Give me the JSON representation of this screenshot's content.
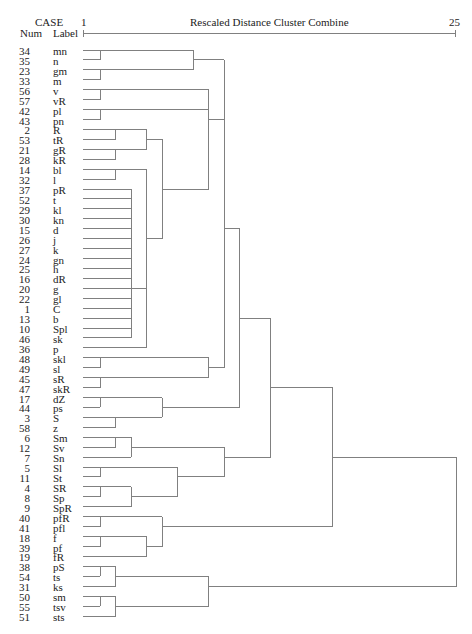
{
  "chart_data": {
    "type": "dendrogram",
    "title": "Rescaled Distance Cluster Combine",
    "header": {
      "case": "CASE",
      "num": "Num",
      "label": "Label"
    },
    "axis": {
      "label": "Rescaled Distance Cluster Combine",
      "range": [
        1,
        25
      ],
      "tick_labels": [
        "1",
        "25"
      ],
      "grid": false
    },
    "leaves": [
      {
        "num": 34,
        "label": "mn"
      },
      {
        "num": 35,
        "label": "n"
      },
      {
        "num": 23,
        "label": "gm"
      },
      {
        "num": 33,
        "label": "m"
      },
      {
        "num": 56,
        "label": "v"
      },
      {
        "num": 57,
        "label": "vR"
      },
      {
        "num": 42,
        "label": "pl"
      },
      {
        "num": 43,
        "label": "pn"
      },
      {
        "num": 2,
        "label": "R"
      },
      {
        "num": 53,
        "label": "tR"
      },
      {
        "num": 21,
        "label": "gR"
      },
      {
        "num": 28,
        "label": "kR"
      },
      {
        "num": 14,
        "label": "bl"
      },
      {
        "num": 32,
        "label": "l"
      },
      {
        "num": 37,
        "label": "pR"
      },
      {
        "num": 52,
        "label": "t"
      },
      {
        "num": 29,
        "label": "kl"
      },
      {
        "num": 30,
        "label": "kn"
      },
      {
        "num": 15,
        "label": "d"
      },
      {
        "num": 26,
        "label": "j"
      },
      {
        "num": 27,
        "label": "k"
      },
      {
        "num": 24,
        "label": "gn"
      },
      {
        "num": 25,
        "label": "h"
      },
      {
        "num": 16,
        "label": "dR"
      },
      {
        "num": 20,
        "label": "g"
      },
      {
        "num": 22,
        "label": "gl"
      },
      {
        "num": 1,
        "label": "C"
      },
      {
        "num": 13,
        "label": "b"
      },
      {
        "num": 10,
        "label": "Spl"
      },
      {
        "num": 46,
        "label": "sk"
      },
      {
        "num": 36,
        "label": "p"
      },
      {
        "num": 48,
        "label": "skl"
      },
      {
        "num": 49,
        "label": "sl"
      },
      {
        "num": 45,
        "label": "sR"
      },
      {
        "num": 47,
        "label": "skR"
      },
      {
        "num": 17,
        "label": "dZ"
      },
      {
        "num": 44,
        "label": "ps"
      },
      {
        "num": 3,
        "label": "S"
      },
      {
        "num": 58,
        "label": "z"
      },
      {
        "num": 6,
        "label": "Sm"
      },
      {
        "num": 12,
        "label": "Sv"
      },
      {
        "num": 7,
        "label": "Sn"
      },
      {
        "num": 5,
        "label": "Sl"
      },
      {
        "num": 11,
        "label": "St"
      },
      {
        "num": 4,
        "label": "SR"
      },
      {
        "num": 8,
        "label": "Sp"
      },
      {
        "num": 9,
        "label": "SpR"
      },
      {
        "num": 40,
        "label": "pfR"
      },
      {
        "num": 41,
        "label": "pfl"
      },
      {
        "num": 18,
        "label": "f"
      },
      {
        "num": 39,
        "label": "pf"
      },
      {
        "num": 19,
        "label": "fR"
      },
      {
        "num": 38,
        "label": "pS"
      },
      {
        "num": 54,
        "label": "ts"
      },
      {
        "num": 31,
        "label": "ks"
      },
      {
        "num": 50,
        "label": "sm"
      },
      {
        "num": 55,
        "label": "tsv"
      },
      {
        "num": 51,
        "label": "sts"
      }
    ],
    "tree_note": "Leaves referenced by 1-based row position in 'leaves'. d = rescaled merge distance. Optional 'row' = output row of a multi-way merge.",
    "tree": {
      "d": 25,
      "c": [
        {
          "d": 17,
          "c": [
            {
              "d": 13,
              "c": [
                {
                  "d": 11,
                  "c": [
                    {
                      "d": 10,
                      "c": [
                        {
                          "d": 10,
                          "c": [
                            {
                              "d": 8,
                              "c": [
                                {
                                  "d": 2,
                                  "c": [
                                    1,
                                    2
                                  ]
                                },
                                {
                                  "d": 2,
                                  "c": [
                                    3,
                                    4
                                  ]
                                }
                              ]
                            },
                            {
                              "d": 9,
                              "c": [
                                {
                                  "d": 2,
                                  "c": [
                                    5,
                                    6
                                  ]
                                },
                                {
                                  "d": 9,
                                  "c": [
                                    {
                                      "d": 2,
                                      "c": [
                                        7,
                                        8
                                      ]
                                    },
                                    {
                                      "d": 6,
                                      "c": [
                                        {
                                          "d": 5,
                                          "c": [
                                            {
                                              "d": 3,
                                              "c": [
                                                9,
                                                10
                                              ]
                                            },
                                            {
                                              "d": 3,
                                              "c": [
                                                11,
                                                12
                                              ]
                                            }
                                          ]
                                        },
                                        {
                                          "d": 5,
                                          "c": [
                                            {
                                              "d": 3,
                                              "c": [
                                                13,
                                                14
                                              ]
                                            },
                                            {
                                              "d": 5,
                                              "c": [
                                                {
                                                  "d": 4,
                                                  "row": 25,
                                                  "c": [
                                                    15,
                                                    16,
                                                    17,
                                                    18,
                                                    19,
                                                    20,
                                                    21,
                                                    22,
                                                    23,
                                                    24,
                                                    25,
                                                    26,
                                                    27,
                                                    28,
                                                    29,
                                                    30
                                                  ]
                                                },
                                                31
                                              ]
                                            }
                                          ]
                                        }
                                      ]
                                    }
                                  ]
                                }
                              ]
                            }
                          ]
                        },
                        {
                          "d": 9,
                          "c": [
                            {
                              "d": 2,
                              "c": [
                                32,
                                33
                              ]
                            },
                            {
                              "d": 2,
                              "c": [
                                34,
                                35
                              ]
                            }
                          ]
                        }
                      ]
                    },
                    {
                      "d": 6,
                      "c": [
                        {
                          "d": 2,
                          "c": [
                            36,
                            37
                          ]
                        },
                        {
                          "d": 3,
                          "c": [
                            38,
                            39
                          ]
                        }
                      ]
                    }
                  ]
                },
                {
                  "d": 10,
                  "c": [
                    {
                      "d": 4,
                      "c": [
                        {
                          "d": 3,
                          "c": [
                            40,
                            41
                          ]
                        },
                        42
                      ]
                    },
                    {
                      "d": 7,
                      "c": [
                        {
                          "d": 2,
                          "c": [
                            43,
                            44
                          ]
                        },
                        {
                          "d": 4,
                          "c": [
                            {
                              "d": 2,
                              "c": [
                                45,
                                46
                              ]
                            },
                            47
                          ]
                        }
                      ]
                    }
                  ]
                }
              ]
            },
            {
              "d": 6,
              "c": [
                {
                  "d": 2,
                  "c": [
                    48,
                    49
                  ]
                },
                {
                  "d": 5,
                  "c": [
                    {
                      "d": 2,
                      "c": [
                        50,
                        51
                      ]
                    },
                    52
                  ]
                }
              ]
            }
          ]
        },
        {
          "d": 9,
          "c": [
            {
              "d": 3,
              "c": [
                {
                  "d": 2,
                  "c": [
                    53,
                    54
                  ]
                },
                55
              ]
            },
            {
              "d": 3,
              "c": [
                {
                  "d": 2,
                  "c": [
                    56,
                    57
                  ]
                },
                58
              ]
            }
          ]
        }
      ]
    }
  }
}
